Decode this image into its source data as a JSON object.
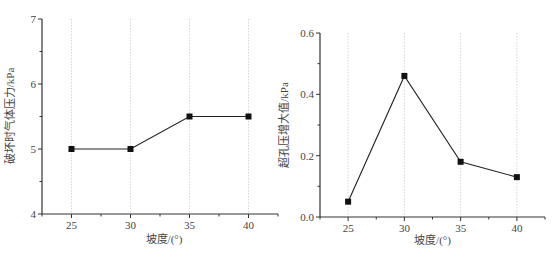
{
  "chart_data": [
    {
      "type": "line",
      "title": "",
      "xlabel": "坡度/(°)",
      "ylabel": "破坏时气体压力/kPa",
      "x": [
        25,
        30,
        35,
        40
      ],
      "series": [
        {
          "name": "破坏时气体压力",
          "values": [
            5.0,
            5.0,
            5.5,
            5.5
          ]
        }
      ],
      "xticks": [
        "25",
        "30",
        "35",
        "40"
      ],
      "yticks": [
        "4",
        "5",
        "6",
        "7"
      ],
      "xlim": [
        22.5,
        42.5
      ],
      "ylim": [
        4,
        7
      ],
      "grid": "vertical dotted at major x ticks",
      "marker": "square",
      "legend": null
    },
    {
      "type": "line",
      "title": "",
      "xlabel": "坡度/(°)",
      "ylabel": "超孔压增大值/kPa",
      "x": [
        25,
        30,
        35,
        40
      ],
      "series": [
        {
          "name": "超孔压增大值",
          "values": [
            0.05,
            0.46,
            0.18,
            0.13
          ]
        }
      ],
      "xticks": [
        "25",
        "30",
        "35",
        "40"
      ],
      "yticks": [
        "0.0",
        "0.2",
        "0.4",
        "0.6"
      ],
      "xlim": [
        22.5,
        42.5
      ],
      "ylim": [
        0,
        0.6
      ],
      "grid": "vertical dotted at major x ticks",
      "marker": "square",
      "legend": null
    }
  ],
  "colors": {
    "line": "#222222",
    "marker": "#111111",
    "axis": "#333333",
    "grid": "#cccccc"
  }
}
